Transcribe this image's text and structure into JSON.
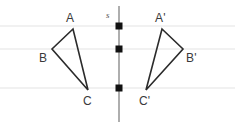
{
  "figure": {
    "width": 235,
    "height": 126,
    "background_color": "#ffffff"
  },
  "grid": {
    "line_color": "#e3e3e3",
    "line_width": 1,
    "horizontal_lines_y": [
      26,
      49,
      88
    ]
  },
  "mirror_line": {
    "label": "s",
    "label_x": 106,
    "label_y": 11,
    "x": 119,
    "y_top": 6,
    "y_bottom": 122,
    "color": "#9a9a9a",
    "width": 1.6
  },
  "markers": {
    "name": "intersection-squares",
    "color": "#111111",
    "size": 7,
    "points": [
      {
        "x": 119,
        "y": 26
      },
      {
        "x": 119,
        "y": 49
      },
      {
        "x": 119,
        "y": 88
      }
    ]
  },
  "shapes": {
    "stroke_color": "#2b2b2b",
    "stroke_width": 1.6,
    "fill": "none",
    "triangles": [
      {
        "name": "triangle-abc",
        "vertices": [
          {
            "label": "A",
            "x": 73,
            "y": 29,
            "label_x": 66,
            "label_y": 12
          },
          {
            "label": "B",
            "x": 52,
            "y": 49,
            "label_x": 39,
            "label_y": 52
          },
          {
            "label": "C",
            "x": 88,
            "y": 90,
            "label_x": 83,
            "label_y": 95
          }
        ]
      },
      {
        "name": "triangle-a-prime-b-prime-c-prime",
        "vertices": [
          {
            "label": "A'",
            "x": 162,
            "y": 29,
            "label_x": 155,
            "label_y": 12
          },
          {
            "label": "B'",
            "x": 183,
            "y": 49,
            "label_x": 186,
            "label_y": 52
          },
          {
            "label": "C'",
            "x": 146,
            "y": 90,
            "label_x": 139,
            "label_y": 95
          }
        ]
      }
    ]
  },
  "labels": {
    "A": "A",
    "B": "B",
    "C": "C",
    "A_prime": "A'",
    "B_prime": "B'",
    "C_prime": "C'",
    "s": "s"
  }
}
